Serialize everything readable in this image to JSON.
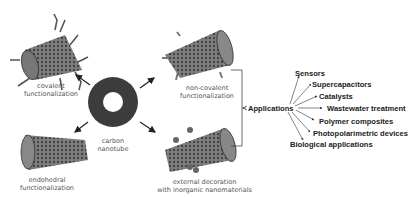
{
  "diagram": {
    "center": {
      "label_line1": "carbon",
      "label_line2": "nanotube"
    },
    "functionalizations": [
      {
        "id": "covalent",
        "line1": "covalent",
        "line2": "functionalization"
      },
      {
        "id": "non-covalent",
        "line1": "non-covalent",
        "line2": "functionalization"
      },
      {
        "id": "endohedral",
        "line1": "endohedral",
        "line2": "functionalization"
      },
      {
        "id": "external-decoration",
        "line1": "external decoration",
        "line2": "with inorganic nanomaterials"
      }
    ],
    "applications": {
      "label": "Applications",
      "items": [
        "Sensors",
        "Supercapacitors",
        "Catalysts",
        "Wastewater treatment",
        "Polymer composites",
        "Photopolarimetric devices",
        "Biological applications"
      ]
    },
    "colors": {
      "tube": "#3a3a3a",
      "ring": "#3c3c3c",
      "text": "#222222",
      "label": "#555555"
    }
  }
}
